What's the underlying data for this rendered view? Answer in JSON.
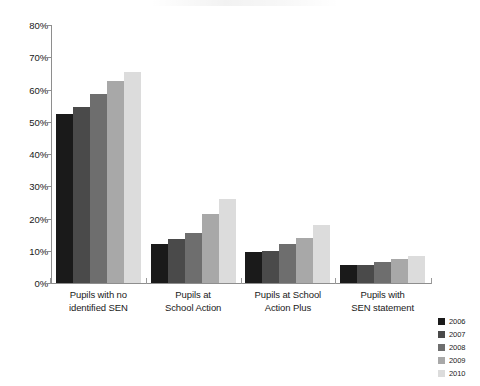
{
  "chart_data": {
    "type": "bar",
    "title": "",
    "subtitle": "",
    "xlabel": "",
    "ylabel": "",
    "ylim": [
      0,
      80
    ],
    "y_ticks": [
      "0%",
      "10%",
      "20%",
      "30%",
      "40%",
      "50%",
      "60%",
      "70%",
      "80%"
    ],
    "y_tick_values": [
      0,
      10,
      20,
      30,
      40,
      50,
      60,
      70,
      80
    ],
    "grid": false,
    "legend_position": "bottom-right",
    "categories": [
      "Pupils with no identified SEN",
      "Pupils at School Action",
      "Pupils at School Action Plus",
      "Pupils with SEN statement"
    ],
    "category_lines": [
      [
        "Pupils with no",
        "identified SEN"
      ],
      [
        "Pupils at",
        "School Action"
      ],
      [
        "Pupils at School",
        "Action Plus"
      ],
      [
        "Pupils with",
        "SEN statement"
      ]
    ],
    "series": [
      {
        "name": "2006",
        "color": "#1a1a1a",
        "values": [
          52.5,
          12.0,
          9.5,
          5.5
        ]
      },
      {
        "name": "2007",
        "color": "#4a4a4a",
        "values": [
          54.5,
          13.5,
          10.0,
          5.5
        ]
      },
      {
        "name": "2008",
        "color": "#6e6e6e",
        "values": [
          58.5,
          15.5,
          12.0,
          6.5
        ]
      },
      {
        "name": "2009",
        "color": "#a8a8a8",
        "values": [
          62.5,
          21.5,
          14.0,
          7.5
        ]
      },
      {
        "name": "2010",
        "color": "#dcdcdc",
        "values": [
          65.5,
          26.0,
          18.0,
          8.5
        ]
      }
    ]
  },
  "axis": {
    "line_color": "#8e8e8e"
  }
}
